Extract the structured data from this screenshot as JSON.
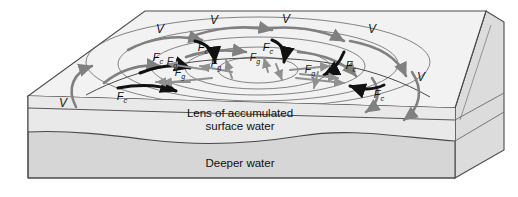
{
  "figure": {
    "background_color": "#ffffff"
  },
  "block": {
    "top_face_color": "#f2f2f2",
    "front_face_lens_color": "#e9e9e9",
    "front_face_deep_color": "#d6d6d6",
    "right_face_color": "#dcdcdc",
    "edge_color": "#4a4a4a"
  },
  "layers": [
    {
      "id": "lens",
      "label_line1": "Lens of accumulated",
      "label_line2": "surface water"
    },
    {
      "id": "deep",
      "label_line1": "Deeper water",
      "label_line2": ""
    }
  ],
  "legend_symbols": {
    "velocity": {
      "symbol": "V",
      "color": "#808080",
      "meaning": "velocity"
    },
    "coriolis": {
      "symbol": "F",
      "subscript": "c",
      "color": "#000000",
      "meaning": "Coriolis force"
    },
    "gravity": {
      "symbol": "F",
      "subscript": "g",
      "color": "#8c8c8c",
      "meaning": "gravity force"
    }
  },
  "labels": {
    "velocity": [
      {
        "text": "V",
        "x": 63,
        "y": 107
      },
      {
        "text": "V",
        "x": 160,
        "y": 33
      },
      {
        "text": "V",
        "x": 214,
        "y": 24
      },
      {
        "text": "V",
        "x": 286,
        "y": 23
      },
      {
        "text": "V",
        "x": 372,
        "y": 33
      },
      {
        "text": "V",
        "x": 421,
        "y": 81
      }
    ],
    "coriolis": [
      {
        "text": "F",
        "sub": "c",
        "x": 122,
        "y": 100
      },
      {
        "text": "F",
        "sub": "c",
        "x": 158,
        "y": 61
      },
      {
        "text": "F",
        "sub": "c",
        "x": 203,
        "y": 51
      },
      {
        "text": "F",
        "sub": "c",
        "x": 268,
        "y": 51
      },
      {
        "text": "F",
        "sub": "c",
        "x": 351,
        "y": 69
      },
      {
        "text": "F",
        "sub": "c",
        "x": 379,
        "y": 98
      }
    ],
    "gravity": [
      {
        "text": "F",
        "sub": "g",
        "x": 180,
        "y": 76
      },
      {
        "text": "F",
        "sub": "g",
        "x": 216,
        "y": 67
      },
      {
        "text": "F",
        "sub": "g",
        "x": 255,
        "y": 61
      },
      {
        "text": "F",
        "sub": "g",
        "x": 310,
        "y": 73
      },
      {
        "text": "F",
        "sub": "g",
        "x": 172,
        "y": 65
      }
    ]
  }
}
